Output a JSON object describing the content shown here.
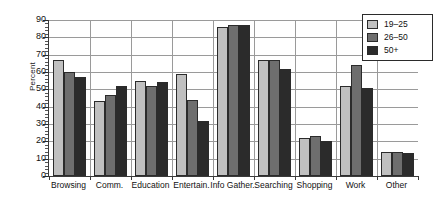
{
  "chart_data": {
    "type": "bar",
    "title": "",
    "xlabel": "",
    "ylabel": "Percent",
    "ylim": [
      0,
      90
    ],
    "yticks": [
      0,
      10,
      20,
      30,
      40,
      50,
      60,
      70,
      80,
      90
    ],
    "ytick_labels": [
      "0",
      "10",
      "20",
      "30",
      "40",
      "50",
      "60",
      "70",
      "80",
      "90"
    ],
    "grid": true,
    "legend_position": "top-right",
    "categories": [
      "Browsing",
      "Comm.",
      "Education",
      "Entertain.",
      "Info Gather.",
      "Searching",
      "Shopping",
      "Work",
      "Other"
    ],
    "series": [
      {
        "name": "19–25",
        "color": "#c0c0c0",
        "values": [
          67,
          43,
          55,
          59,
          86,
          67,
          22,
          52,
          14
        ]
      },
      {
        "name": "26–50",
        "color": "#6e6e6e",
        "values": [
          60,
          47,
          52,
          44,
          87,
          67,
          23,
          64,
          14
        ]
      },
      {
        "name": "50+",
        "color": "#2b2b2b",
        "values": [
          57,
          52,
          54,
          32,
          87,
          62,
          20,
          51,
          13
        ]
      }
    ]
  },
  "legend": {
    "items": [
      {
        "label": "19–25",
        "color": "#c0c0c0"
      },
      {
        "label": "26–50",
        "color": "#6e6e6e"
      },
      {
        "label": "50+",
        "color": "#2b2b2b"
      }
    ]
  },
  "axes": {
    "y_title": "Percent"
  }
}
